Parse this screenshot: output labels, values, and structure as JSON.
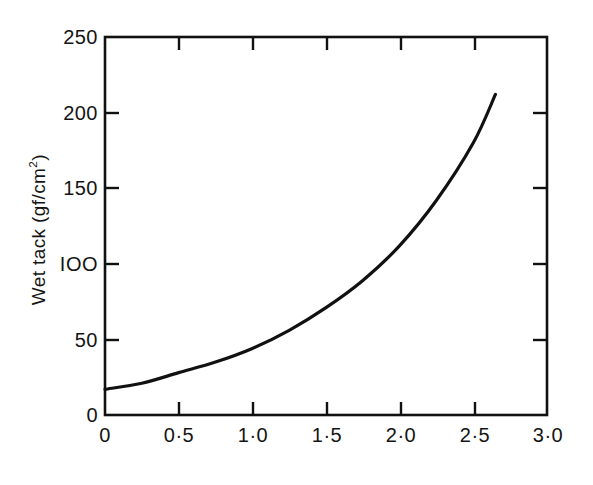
{
  "chart_data": {
    "type": "line",
    "title": "",
    "xlabel": "Polyvinyl alcohol (% of weight of resin solution)",
    "ylabel_text": "Wet tack (gf/cm",
    "ylabel_sup": "2",
    "ylabel_tail": ")",
    "ylabel_full": "Wet tack (gf/cm2)",
    "xlim": [
      0,
      3.0
    ],
    "ylim": [
      0,
      250
    ],
    "grid": false,
    "legend": "none",
    "xticks": [
      0,
      0.5,
      1.0,
      1.5,
      2.0,
      2.5,
      3.0
    ],
    "xtick_labels": [
      "0",
      "0·5",
      "1·0",
      "1·5",
      "2·0",
      "2·5",
      "3·0"
    ],
    "yticks": [
      0,
      50,
      100,
      150,
      200,
      250
    ],
    "ytick_labels": [
      "0",
      "50",
      "IOO",
      "150",
      "200",
      "250"
    ],
    "series": [
      {
        "name": "wet tack",
        "color": "#111111",
        "x": [
          0.0,
          0.25,
          0.5,
          0.75,
          1.0,
          1.25,
          1.5,
          1.75,
          2.0,
          2.25,
          2.5,
          2.65
        ],
        "y": [
          17,
          21,
          28,
          35,
          44,
          56,
          71,
          89,
          112,
          142,
          180,
          212
        ]
      }
    ]
  },
  "axes": {
    "frame_color": "#111111",
    "tick_direction": "in",
    "x_axis_name": "x-axis",
    "y_axis_name": "y-axis"
  }
}
